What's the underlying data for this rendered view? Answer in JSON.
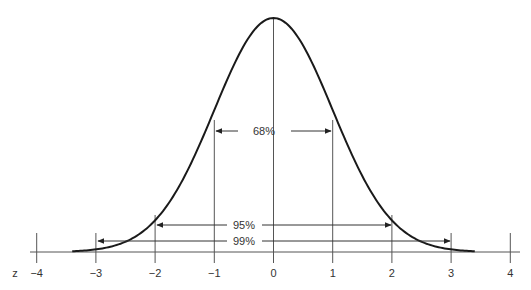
{
  "chart_data": {
    "type": "line",
    "title": "",
    "subtitle": "",
    "xlabel": "z",
    "ylabel": "",
    "xlim": [
      -4,
      4
    ],
    "grid": false,
    "legend": null,
    "series": [
      {
        "name": "standard normal density",
        "function": "exp(-z^2/2)/sqrt(2*pi)",
        "x_range": [
          -3.4,
          3.4
        ]
      }
    ],
    "x_ticks": [
      -4,
      -3,
      -2,
      -1,
      0,
      1,
      2,
      3,
      4
    ],
    "x_tick_labels": [
      "−4",
      "−3",
      "−2",
      "−1",
      "0",
      "1",
      "2",
      "3",
      "4"
    ],
    "vertical_lines_at": [
      -3,
      -2,
      -1,
      0,
      1,
      2,
      3
    ],
    "annotations": [
      {
        "label": "68%",
        "from": -1,
        "to": 1,
        "type": "double-arrow"
      },
      {
        "label": "95%",
        "from": -2,
        "to": 2,
        "type": "double-arrow"
      },
      {
        "label": "99%",
        "from": -3,
        "to": 3,
        "type": "double-arrow"
      }
    ]
  },
  "axis": {
    "z_label": "z",
    "ticks": [
      {
        "value": -4,
        "label": "−4"
      },
      {
        "value": -3,
        "label": "−3"
      },
      {
        "value": -2,
        "label": "−2"
      },
      {
        "value": -1,
        "label": "−1"
      },
      {
        "value": 0,
        "label": "0"
      },
      {
        "value": 1,
        "label": "1"
      },
      {
        "value": 2,
        "label": "2"
      },
      {
        "value": 3,
        "label": "3"
      },
      {
        "value": 4,
        "label": "4"
      }
    ]
  },
  "intervals": {
    "one_sigma": "68%",
    "two_sigma": "95%",
    "three_sigma": "99%"
  },
  "colors": {
    "curve": "#1a1a1a",
    "lines": "#555555",
    "text": "#333333"
  }
}
